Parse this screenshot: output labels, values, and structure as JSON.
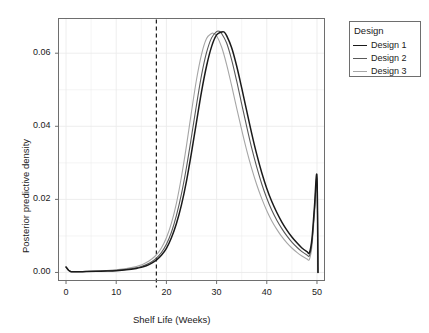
{
  "chart_data": {
    "type": "line",
    "title": "",
    "xlabel": "Shelf Life (Weeks)",
    "ylabel": "Posterior predictive density",
    "xlim": [
      -1.5,
      51.5
    ],
    "ylim": [
      -0.0022,
      0.0695
    ],
    "xticks": [
      0,
      10,
      20,
      30,
      40,
      50
    ],
    "xtick_labels": [
      "0",
      "10",
      "20",
      "30",
      "40",
      "50"
    ],
    "yticks": [
      0.0,
      0.02,
      0.04,
      0.06
    ],
    "ytick_labels": [
      "0.00",
      "0.02",
      "0.04",
      "0.06"
    ],
    "grid": true,
    "legend_position": "right",
    "legend_title": "Design",
    "annotations": [
      {
        "type": "vline",
        "x": 18,
        "style": "dashed",
        "color": "#1a1a1a",
        "label": "spec limit 18 weeks"
      }
    ],
    "series": [
      {
        "name": "Design 1",
        "color": "#1a1a1a",
        "x": [
          0,
          0.5,
          1,
          2,
          4,
          6,
          8,
          10,
          12,
          14,
          15,
          16,
          17,
          18,
          19,
          20,
          21,
          22,
          23,
          24,
          25,
          26,
          27,
          28,
          29,
          30,
          31,
          31.5,
          32,
          33,
          34,
          35,
          36,
          37,
          38,
          39,
          40,
          41,
          42,
          43,
          44,
          45,
          46,
          47,
          48,
          48.5,
          49,
          49.5,
          50,
          50.2
        ],
        "y": [
          0.0015,
          0.0006,
          0.00022,
          0.0002,
          0.00024,
          0.0003,
          0.00038,
          0.0005,
          0.00072,
          0.0011,
          0.0014,
          0.00185,
          0.0025,
          0.0034,
          0.0047,
          0.0066,
          0.0095,
          0.0134,
          0.0185,
          0.025,
          0.0328,
          0.0412,
          0.0495,
          0.0565,
          0.0618,
          0.065,
          0.0658,
          0.0658,
          0.0648,
          0.0615,
          0.0565,
          0.0505,
          0.0442,
          0.038,
          0.0323,
          0.0273,
          0.023,
          0.0194,
          0.0164,
          0.0138,
          0.0116,
          0.0097,
          0.0081,
          0.0067,
          0.0057,
          0.0054,
          0.0092,
          0.018,
          0.0263,
          0.0
        ]
      },
      {
        "name": "Design 2",
        "color": "#595959",
        "x": [
          0,
          0.5,
          1,
          2,
          4,
          6,
          8,
          10,
          12,
          14,
          15,
          16,
          17,
          18,
          19,
          20,
          21,
          22,
          23,
          24,
          25,
          26,
          27,
          28,
          29,
          30,
          30.5,
          31,
          32,
          33,
          34,
          35,
          36,
          37,
          38,
          39,
          40,
          41,
          42,
          43,
          44,
          45,
          46,
          47,
          48,
          48.5,
          49,
          49.5,
          50,
          50.2
        ],
        "y": [
          0.0015,
          0.0006,
          0.00022,
          0.00021,
          0.00026,
          0.00034,
          0.00044,
          0.00058,
          0.00084,
          0.00128,
          0.00163,
          0.00215,
          0.00288,
          0.0039,
          0.00545,
          0.0077,
          0.011,
          0.0156,
          0.0215,
          0.0288,
          0.0372,
          0.0459,
          0.054,
          0.0602,
          0.0642,
          0.0659,
          0.066,
          0.0654,
          0.0628,
          0.0582,
          0.0524,
          0.0461,
          0.0399,
          0.034,
          0.0288,
          0.0242,
          0.0203,
          0.017,
          0.0143,
          0.012,
          0.01,
          0.0083,
          0.0069,
          0.0057,
          0.0048,
          0.0046,
          0.0083,
          0.017,
          0.0253,
          0.0
        ]
      },
      {
        "name": "Design 3",
        "color": "#a6a6a6",
        "x": [
          0,
          0.5,
          1,
          2,
          4,
          6,
          8,
          10,
          12,
          14,
          15,
          16,
          17,
          18,
          19,
          20,
          21,
          22,
          23,
          24,
          25,
          26,
          27,
          28,
          29,
          29.3,
          30,
          31,
          32,
          33,
          34,
          35,
          36,
          37,
          38,
          39,
          40,
          41,
          42,
          43,
          44,
          45,
          46,
          47,
          48,
          48.5,
          49,
          49.5,
          50,
          50.2
        ],
        "y": [
          0.0015,
          0.00062,
          0.00024,
          0.00023,
          0.0003,
          0.0004,
          0.00053,
          0.00072,
          0.00105,
          0.0016,
          0.00205,
          0.0027,
          0.0036,
          0.0048,
          0.0067,
          0.0095,
          0.0135,
          0.019,
          0.0262,
          0.0347,
          0.044,
          0.0528,
          0.0597,
          0.064,
          0.0654,
          0.06545,
          0.0648,
          0.0617,
          0.0569,
          0.0511,
          0.045,
          0.039,
          0.0334,
          0.0284,
          0.024,
          0.0202,
          0.0169,
          0.0141,
          0.0118,
          0.0098,
          0.0081,
          0.0067,
          0.0055,
          0.0045,
          0.0037,
          0.0036,
          0.0072,
          0.0158,
          0.024,
          0.0
        ]
      }
    ]
  },
  "legend": {
    "title": "Design",
    "items": [
      {
        "label": "Design 1",
        "color": "#1a1a1a"
      },
      {
        "label": "Design 2",
        "color": "#595959"
      },
      {
        "label": "Design 3",
        "color": "#a6a6a6"
      }
    ]
  },
  "axes": {
    "x_title": "Shelf Life (Weeks)",
    "y_title": "Posterior predictive density",
    "x_tick_labels": [
      "0",
      "10",
      "20",
      "30",
      "40",
      "50"
    ],
    "y_tick_labels": [
      "0.00",
      "0.02",
      "0.04",
      "0.06"
    ]
  },
  "style": {
    "panel_background": "#ffffff",
    "panel_border": "#6e6e6e",
    "grid_color": "#ebebeb",
    "text_color": "#1a1a1a",
    "vline_color": "#1a1a1a"
  }
}
